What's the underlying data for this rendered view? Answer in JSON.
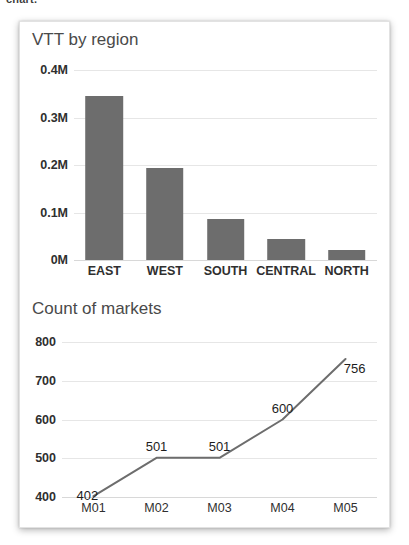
{
  "page": {
    "top_fragment": "chart."
  },
  "card": {
    "charts": [
      {
        "title": "VTT by region",
        "type": "bar"
      },
      {
        "title": "Count of markets",
        "type": "line"
      }
    ]
  },
  "chart_data": [
    {
      "type": "bar",
      "title": "VTT by region",
      "xlabel": "",
      "ylabel": "",
      "categories": [
        "EAST",
        "WEST",
        "SOUTH",
        "CENTRAL",
        "NORTH"
      ],
      "values": [
        345000,
        193000,
        86000,
        44000,
        21000
      ],
      "ylim": [
        0,
        400000
      ],
      "yticks": [
        0,
        100000,
        200000,
        300000,
        400000
      ],
      "ytick_labels": [
        "0M",
        "0.1M",
        "0.2M",
        "0.3M",
        "0.4M"
      ],
      "grid": true,
      "legend": "none",
      "bar_color": "#6d6d6d",
      "data_labels": false
    },
    {
      "type": "line",
      "title": "Count of markets",
      "xlabel": "",
      "ylabel": "",
      "categories": [
        "M01",
        "M02",
        "M03",
        "M04",
        "M05"
      ],
      "values": [
        402,
        501,
        501,
        600,
        756
      ],
      "point_labels": [
        "402",
        "501",
        "501",
        "600",
        "756"
      ],
      "ylim": [
        400,
        800
      ],
      "yticks": [
        400,
        500,
        600,
        700,
        800
      ],
      "ytick_labels": [
        "400",
        "500",
        "600",
        "700",
        "800"
      ],
      "grid": true,
      "legend": "none",
      "line_color": "#6d6d6d",
      "data_labels": true
    }
  ],
  "colors": {
    "card_background": "#ffffff",
    "card_border": "#e2e2e2",
    "series": "#6d6d6d",
    "gridline": "#e6e6e6",
    "title_text": "#4a4a4a",
    "axis_text": "#2f2f2f"
  }
}
